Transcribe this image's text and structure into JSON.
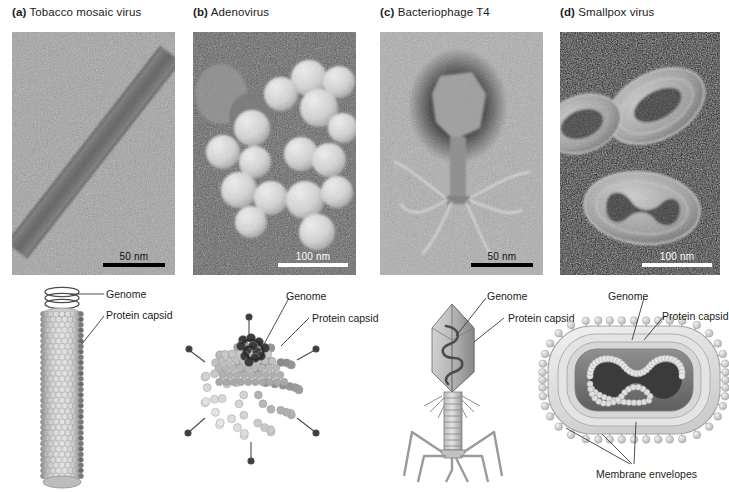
{
  "figure": {
    "type": "scientific-figure-virus-structures",
    "panel_count": 4
  },
  "panels": [
    {
      "letter": "(a)",
      "title": "Tobacco mosaic virus",
      "micrograph": {
        "scalebar": "50 nm",
        "scalebar_color": "#000000",
        "background": "gray-negative-stain"
      },
      "diagram": {
        "shape": "helical rod",
        "labels": [
          {
            "name": "genome",
            "text": "Genome"
          },
          {
            "name": "protein-capsid",
            "text": "Protein capsid"
          }
        ]
      }
    },
    {
      "letter": "(b)",
      "title": "Adenovirus",
      "micrograph": {
        "scalebar": "100 nm",
        "scalebar_color": "#ffffff",
        "background": "dark-shadowed"
      },
      "diagram": {
        "shape": "icosahedral capsid with fibers",
        "labels": [
          {
            "name": "genome",
            "text": "Genome"
          },
          {
            "name": "protein-capsid",
            "text": "Protein capsid"
          }
        ]
      }
    },
    {
      "letter": "(c)",
      "title": "Bacteriophage T4",
      "micrograph": {
        "scalebar": "50 nm",
        "scalebar_color": "#000000",
        "background": "light-negative-stain"
      },
      "diagram": {
        "shape": "head-tail bacteriophage",
        "labels": [
          {
            "name": "genome",
            "text": "Genome"
          },
          {
            "name": "protein-capsid",
            "text": "Protein capsid"
          }
        ]
      }
    },
    {
      "letter": "(d)",
      "title": "Smallpox virus",
      "micrograph": {
        "scalebar": "100 nm",
        "scalebar_color": "#ffffff",
        "background": "dark-field"
      },
      "diagram": {
        "shape": "enveloped brick with dumbbell core",
        "labels": [
          {
            "name": "genome",
            "text": "Genome"
          },
          {
            "name": "protein-capsid",
            "text": "Protein capsid"
          },
          {
            "name": "membrane-envelopes",
            "text": "Membrane envelopes"
          }
        ]
      }
    }
  ]
}
